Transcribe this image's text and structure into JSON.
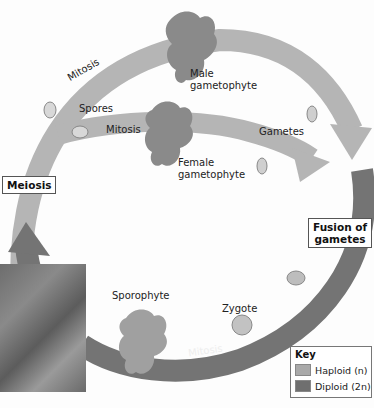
{
  "diagram": {
    "type": "life-cycle",
    "labels": {
      "mitosis_top": "Mitosis",
      "spores": "Spores",
      "mitosis_middle": "Mitosis",
      "male_gametophyte_line1": "Male",
      "male_gametophyte_line2": "gametophyte",
      "female_gametophyte_line1": "Female",
      "female_gametophyte_line2": "gametophyte",
      "gametes": "Gametes",
      "meiosis": "Meiosis",
      "fusion_line1": "Fusion of",
      "fusion_line2": "gametes",
      "sporophyte": "Sporophyte",
      "zygote": "Zygote",
      "mitosis_bottom": "Mitosis"
    },
    "key": {
      "title": "Key",
      "items": [
        {
          "label": "Haploid (n)",
          "color": "#a9a9a9"
        },
        {
          "label": "Diploid (2n)",
          "color": "#6f6f6f"
        }
      ]
    },
    "colors": {
      "haploid": "#b3b3b3",
      "diploid": "#747474",
      "box_border": "#555555"
    }
  }
}
